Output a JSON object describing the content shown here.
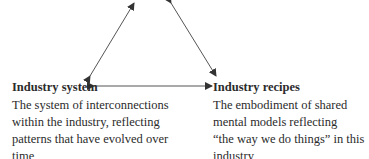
{
  "diagram": {
    "type": "triangle-relationship",
    "nodes": [
      {
        "id": "industry-system",
        "title": "Industry system",
        "description_lines": [
          "The system of interconnections",
          "within the industry, reflecting",
          "patterns that have evolved over",
          "time"
        ]
      },
      {
        "id": "industry-recipes",
        "title": "Industry recipes",
        "description_lines": [
          "The embodiment of shared",
          "mental models reflecting",
          "“the way we do things” in this",
          "industry"
        ]
      }
    ],
    "edges": [
      {
        "from": "industry-system",
        "to": "top-node (cropped)",
        "style": "double-arrow"
      },
      {
        "from": "industry-recipes",
        "to": "top-node (cropped)",
        "style": "double-arrow"
      },
      {
        "from": "industry-system",
        "to": "industry-recipes",
        "style": "double-arrow"
      }
    ],
    "colors": {
      "line": "#333333",
      "text": "#2b2b2b",
      "background": "#ffffff"
    }
  }
}
